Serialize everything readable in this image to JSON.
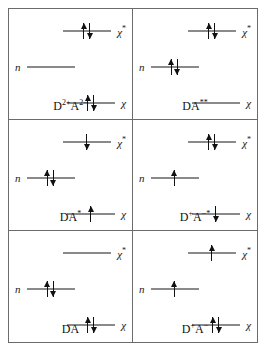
{
  "figure": {
    "name": "molecular-orbital-electron-configuration-diagram",
    "orbital_labels": {
      "chi_star": "χ",
      "chi_star_sup": "*",
      "n": "n",
      "chi": "χ"
    },
    "panels": [
      {
        "id": "panel-d2plus-a2minus",
        "state_base": "D",
        "state_sup_1": "2+",
        "state_mid": "A",
        "state_sup_2": "2−",
        "state_label_text": "D2+A2−",
        "levels": {
          "chi_star": "paired",
          "n": "empty",
          "chi": "paired"
        }
      },
      {
        "id": "panel-da-double-star",
        "state_base": "DA",
        "state_sup_1": "**",
        "state_mid": "",
        "state_sup_2": "",
        "state_label_text": "DA**",
        "levels": {
          "chi_star": "paired",
          "n": "paired",
          "chi": "empty"
        }
      },
      {
        "id": "panel-da-star",
        "state_base": "DA",
        "state_sup_1": "*",
        "state_mid": "",
        "state_sup_2": "",
        "state_label_text": "DA*",
        "levels": {
          "chi_star": "single-down",
          "n": "paired",
          "chi": "single-up"
        }
      },
      {
        "id": "panel-dplus-aminus-star",
        "state_base": "D",
        "state_sup_1": "+",
        "state_mid": "A",
        "state_sup_2": "−*",
        "state_label_text": "D+A−*",
        "levels": {
          "chi_star": "paired",
          "n": "single-up",
          "chi": "single-down"
        }
      },
      {
        "id": "panel-da",
        "state_base": "DA",
        "state_sup_1": "",
        "state_mid": "",
        "state_sup_2": "",
        "state_label_text": "DA",
        "levels": {
          "chi_star": "empty",
          "n": "paired",
          "chi": "paired"
        }
      },
      {
        "id": "panel-dplus-aminus",
        "state_base": "D",
        "state_sup_1": "+",
        "state_mid": "A",
        "state_sup_2": "−",
        "state_label_text": "D+A−",
        "levels": {
          "chi_star": "single-up",
          "n": "single-up",
          "chi": "paired"
        }
      }
    ],
    "colors": {
      "border": "#6b6b6b",
      "orbital_line": "#8a8a8a",
      "arrow": "#111111",
      "text": "#1a1a1a",
      "background": "#ffffff"
    }
  }
}
